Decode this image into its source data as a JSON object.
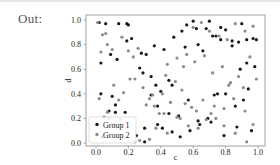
{
  "cell": {
    "output_prompt": "Out:"
  },
  "chart_data": {
    "type": "scatter",
    "title": "",
    "xlabel": "c",
    "ylabel": "d",
    "xlim": [
      -0.05,
      1.05
    ],
    "ylim": [
      -0.03,
      1.03
    ],
    "xticks": [
      "0.0",
      "0.2",
      "0.4",
      "0.6",
      "0.8",
      "1.0"
    ],
    "yticks": [
      "0.0",
      "0.2",
      "0.4",
      "0.6",
      "0.8",
      "1.0"
    ],
    "grid": false,
    "legend_position": "lower left",
    "series": [
      {
        "name": "Group 1",
        "color": "#1a1a1a",
        "x": [
          0.02,
          0.06,
          0.14,
          0.19,
          0.03,
          0.09,
          0.13,
          0.19,
          0.22,
          0.28,
          0.31,
          0.03,
          0.1,
          0.12,
          0.18,
          0.11,
          0.2,
          0.27,
          0.29,
          0.34,
          0.37,
          0.4,
          0.45,
          0.47,
          0.53,
          0.56,
          0.6,
          0.62,
          0.68,
          0.7,
          0.74,
          0.77,
          0.8,
          0.84,
          0.88,
          0.9,
          0.93,
          0.97,
          0.99,
          0.36,
          0.42,
          0.48,
          0.55,
          0.63,
          0.66,
          0.72,
          0.77,
          0.84,
          0.89,
          0.93,
          0.98,
          0.38,
          0.45,
          0.51,
          0.57,
          0.64,
          0.71,
          0.75,
          0.79,
          0.87,
          0.94,
          0.04,
          0.08,
          0.25,
          0.3,
          0.34,
          0.38,
          0.41,
          0.47,
          0.52,
          0.58,
          0.63,
          0.69,
          0.73,
          0.8,
          0.86,
          0.91,
          0.96,
          0.3,
          0.12
        ],
        "y": [
          0.98,
          0.97,
          0.97,
          0.97,
          0.65,
          0.72,
          0.68,
          0.83,
          0.85,
          0.73,
          0.72,
          0.4,
          0.38,
          0.25,
          0.25,
          0.15,
          0.96,
          0.61,
          0.57,
          0.54,
          0.47,
          0.42,
          0.51,
          0.47,
          0.91,
          0.96,
          0.99,
          0.93,
          0.93,
          0.99,
          0.87,
          0.94,
          0.92,
          0.83,
          0.82,
          0.97,
          0.84,
          0.85,
          0.84,
          0.79,
          0.76,
          0.86,
          0.78,
          0.8,
          0.75,
          0.87,
          0.84,
          0.79,
          0.6,
          0.65,
          0.62,
          0.3,
          0.24,
          0.22,
          0.35,
          0.15,
          0.17,
          0.4,
          0.06,
          0.13,
          0.44,
          0.05,
          0.26,
          0.06,
          0.01,
          0.39,
          0.15,
          0.12,
          0.09,
          0.05,
          0.1,
          0.18,
          0.2,
          0.39,
          0.4,
          0.3,
          0.35,
          0.1,
          0.12,
          0.31
        ],
        "marker": "o"
      },
      {
        "name": "Group 2",
        "color": "#8c8c8c",
        "x": [
          0.01,
          0.04,
          0.07,
          0.1,
          0.16,
          0.2,
          0.23,
          0.26,
          0.03,
          0.06,
          0.11,
          0.17,
          0.24,
          0.33,
          0.02,
          0.08,
          0.14,
          0.21,
          0.29,
          0.36,
          0.02,
          0.07,
          0.15,
          0.24,
          0.31,
          0.39,
          0.43,
          0.49,
          0.54,
          0.6,
          0.65,
          0.7,
          0.76,
          0.81,
          0.86,
          0.92,
          0.97,
          0.44,
          0.5,
          0.56,
          0.61,
          0.67,
          0.72,
          0.78,
          0.83,
          0.88,
          0.95,
          0.41,
          0.46,
          0.53,
          0.59,
          0.66,
          0.74,
          0.82,
          0.91,
          0.99,
          0.35,
          0.42,
          0.52,
          0.57,
          0.62,
          0.68,
          0.73,
          0.79,
          0.85,
          0.92,
          0.97,
          0.33,
          0.44,
          0.5,
          0.55,
          0.63,
          0.71,
          0.79,
          0.86,
          0.93,
          0.27,
          0.37,
          0.05,
          0.17
        ],
        "y": [
          0.98,
          0.88,
          0.8,
          0.76,
          0.86,
          0.75,
          0.7,
          0.77,
          0.74,
          0.89,
          0.47,
          0.41,
          0.52,
          0.36,
          0.16,
          0.2,
          0.35,
          0.52,
          0.45,
          0.3,
          0.36,
          0.25,
          0.19,
          0.01,
          0.31,
          0.24,
          0.55,
          0.5,
          0.62,
          0.94,
          0.98,
          0.91,
          0.87,
          0.84,
          0.97,
          0.91,
          0.95,
          0.64,
          0.69,
          0.72,
          0.66,
          0.71,
          0.57,
          0.62,
          0.49,
          0.54,
          0.7,
          0.4,
          0.33,
          0.43,
          0.29,
          0.35,
          0.2,
          0.47,
          0.45,
          0.52,
          0.39,
          0.24,
          0.2,
          0.14,
          0.26,
          0.19,
          0.3,
          0.28,
          0.36,
          0.26,
          0.15,
          0.03,
          0.08,
          0.21,
          0.32,
          0.12,
          0.24,
          0.14,
          0.08,
          0.01,
          0.02,
          0.12,
          0.21,
          0.04
        ],
        "marker": "o"
      }
    ]
  }
}
